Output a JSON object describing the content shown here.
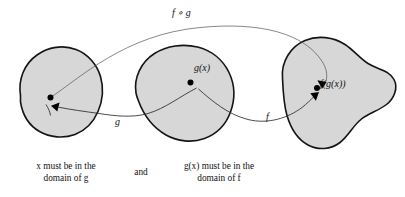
{
  "figure": {
    "name": "function-composition-diagram",
    "background_color": "#ffffff",
    "blob_fill_color": "#d7d7d7",
    "blob_stroke_color": "#141414",
    "arrow_color": "#2b2b2b"
  },
  "labels": {
    "composition": "f ∘ g",
    "middle_point": "g(x)",
    "right_point": "f(g(x))",
    "arrow_g": "g",
    "arrow_f": "f"
  },
  "captions": {
    "left_line1": "x must be in the",
    "left_line2": "domain of g",
    "conjunction": "and",
    "right_line1": "g(x) must be in the",
    "right_line2": "domain of f"
  },
  "sets": [
    {
      "name": "domain-of-g",
      "point_label": "x",
      "point_label_visible": false
    },
    {
      "name": "range-of-g-domain-of-f",
      "point_label": "g(x)",
      "point_label_visible": true
    },
    {
      "name": "range-of-f",
      "point_label": "f(g(x))",
      "point_label_visible": true
    }
  ],
  "arrows": [
    {
      "name": "arrow-g",
      "label": "g",
      "from": "x",
      "to": "g(x)"
    },
    {
      "name": "arrow-f",
      "label": "f",
      "from": "g(x)",
      "to": "f(g(x))"
    },
    {
      "name": "arrow-f-compose-g",
      "label": "f ∘ g",
      "from": "x",
      "to": "f(g(x))"
    }
  ]
}
